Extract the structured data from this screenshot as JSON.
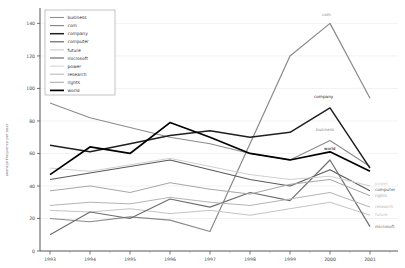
{
  "chart_data": {
    "type": "line",
    "title": "",
    "xlabel": "",
    "ylabel": "average frequency per year",
    "x": [
      1993,
      1994,
      1995,
      1996,
      1997,
      1998,
      1999,
      2000,
      2001
    ],
    "x_tick_labels": [
      "1993",
      "1994",
      "1995",
      "1996",
      "1997",
      "1998",
      "1999",
      "2000",
      "2001"
    ],
    "ylim": [
      0,
      140
    ],
    "yticks": [
      0,
      20,
      40,
      60,
      80,
      100,
      120,
      140
    ],
    "grid": true,
    "legend_position": "top-left",
    "axis_color": "#444444",
    "grid_color": "#e9e9e9",
    "tick_label_color": "#444444",
    "series": [
      {
        "name": "business",
        "color": "#8c8c8c",
        "width": 1.1,
        "values": [
          91,
          82,
          76,
          70,
          66,
          60,
          56,
          68,
          52
        ]
      },
      {
        "name": "com",
        "color": "#8a8a8a",
        "width": 1.2,
        "values": [
          20,
          18,
          21,
          19,
          12,
          66,
          120,
          140,
          94
        ]
      },
      {
        "name": "company",
        "color": "#1f1f1f",
        "width": 1.5,
        "values": [
          65,
          61,
          66,
          71,
          74,
          70,
          73,
          88,
          51
        ]
      },
      {
        "name": "computer",
        "color": "#5a5a5a",
        "width": 1.1,
        "values": [
          44,
          48,
          52,
          56,
          50,
          44,
          40,
          50,
          37
        ]
      },
      {
        "name": "future",
        "color": "#c4c4c4",
        "width": 1.0,
        "values": [
          25,
          24,
          26,
          23,
          25,
          22,
          26,
          30,
          22
        ]
      },
      {
        "name": "microsoft",
        "color": "#6e6e6e",
        "width": 1.2,
        "values": [
          10,
          24,
          20,
          32,
          27,
          36,
          31,
          56,
          15
        ]
      },
      {
        "name": "power",
        "color": "#d0d0d0",
        "width": 1.0,
        "values": [
          51,
          49,
          53,
          57,
          52,
          47,
          44,
          46,
          40
        ]
      },
      {
        "name": "research",
        "color": "#b4b4b4",
        "width": 1.0,
        "values": [
          28,
          30,
          29,
          33,
          30,
          28,
          32,
          36,
          27
        ]
      },
      {
        "name": "rights",
        "color": "#a6a6a6",
        "width": 1.0,
        "values": [
          37,
          40,
          36,
          42,
          38,
          35,
          41,
          44,
          34
        ]
      },
      {
        "name": "world",
        "color": "#000000",
        "width": 1.7,
        "values": [
          47,
          64,
          60,
          79,
          70,
          60,
          56,
          61,
          49
        ]
      }
    ],
    "annotations": [
      {
        "text": "com",
        "x": 322,
        "y": 16,
        "series": "com"
      },
      {
        "text": "company",
        "x": 314,
        "y": 98,
        "series": "company"
      },
      {
        "text": "business",
        "x": 316,
        "y": 131,
        "series": "business"
      },
      {
        "text": "world",
        "x": 324,
        "y": 150,
        "series": "world"
      },
      {
        "text": "power",
        "x": 375,
        "y": 185,
        "series": "power"
      },
      {
        "text": "computer",
        "x": 375,
        "y": 191,
        "series": "computer"
      },
      {
        "text": "rights",
        "x": 375,
        "y": 197,
        "series": "rights"
      },
      {
        "text": "research",
        "x": 375,
        "y": 208,
        "series": "research"
      },
      {
        "text": "future",
        "x": 375,
        "y": 216,
        "series": "future"
      },
      {
        "text": "microsoft",
        "x": 375,
        "y": 228,
        "series": "microsoft"
      }
    ]
  }
}
